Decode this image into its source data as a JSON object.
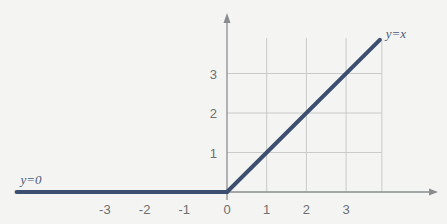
{
  "chart_data": {
    "type": "line",
    "title": "",
    "xlabel": "",
    "ylabel": "",
    "xlim": [
      -5.4,
      5.3
    ],
    "ylim": [
      -0.6,
      4.5
    ],
    "grid": true,
    "grid_x": [
      1,
      2,
      3
    ],
    "grid_y": [
      1,
      2,
      3
    ],
    "x_ticks": [
      -3,
      -2,
      -1,
      0,
      1,
      2,
      3
    ],
    "x_tick_labels": [
      "-3",
      "-2",
      "-1",
      "0",
      "1",
      "2",
      "3"
    ],
    "y_ticks": [
      1,
      2,
      3
    ],
    "y_tick_labels": [
      "1",
      "2",
      "3"
    ],
    "legend": "none (inline annotations)",
    "series": [
      {
        "name": "y=0",
        "x": [
          -5.3,
          0
        ],
        "y": [
          0,
          0
        ]
      },
      {
        "name": "y=x",
        "x": [
          0,
          3.85
        ],
        "y": [
          0,
          3.85
        ]
      }
    ],
    "annotations": [
      {
        "text": "y=0",
        "x": -5.2,
        "y": 0.2
      },
      {
        "text": "y=x",
        "x": 4.0,
        "y": 3.9
      }
    ],
    "colors": {
      "line": "#3d4f70",
      "axis": "#8a8d90",
      "grid": "#c9cbc8",
      "background": "#f4f5f3"
    }
  }
}
